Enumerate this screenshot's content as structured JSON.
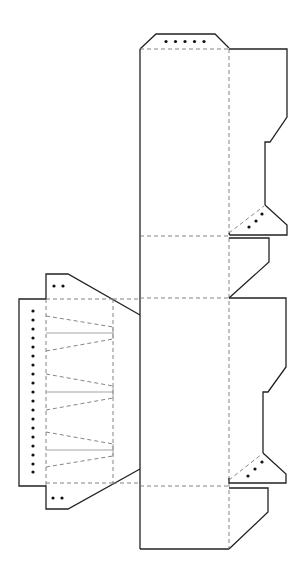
{
  "diagram": {
    "type": "die-cut net",
    "colors": {
      "cut_line": "#222222",
      "fold_line": "#777777",
      "score_line": "#999999",
      "glue_dot": "#111111",
      "background": "#ffffff"
    },
    "legend": {
      "solid": "cut line",
      "dashed": "fold line",
      "dots": "glue area"
    },
    "parts": [
      {
        "name": "top-glue-tab",
        "glue_dots": 5
      },
      {
        "name": "main-front-panel"
      },
      {
        "name": "main-side-panel-upper"
      },
      {
        "name": "main-back-panel"
      },
      {
        "name": "main-side-panel-lower"
      },
      {
        "name": "bottom-panel"
      },
      {
        "name": "right-side-flaps",
        "count": 4
      },
      {
        "name": "triangular-glue-tabs",
        "count": 2,
        "glue_dots_each": 3
      },
      {
        "name": "left-accordion-strip",
        "glue_dots": 19
      },
      {
        "name": "left-small-tabs",
        "count": 2,
        "glue_dots_each": 2
      }
    ]
  }
}
